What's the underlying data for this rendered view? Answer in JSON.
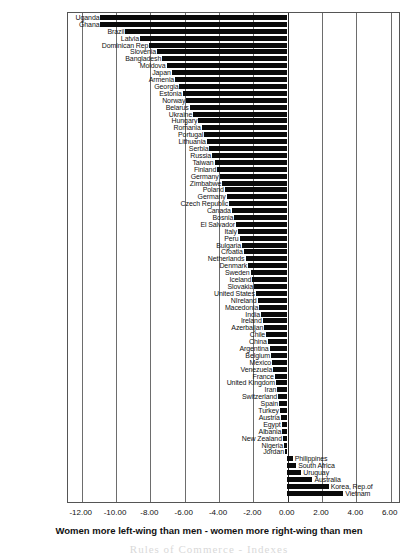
{
  "chart_data": {
    "type": "bar",
    "orientation": "horizontal",
    "title": "",
    "xlabel": "Women more left-wing than men - women more right-wing than men",
    "ylabel": "",
    "xlim": [
      -12.8,
      6.6
    ],
    "xticks": [
      -12.0,
      -10.0,
      -8.0,
      -6.0,
      -4.0,
      -2.0,
      0.0,
      2.0,
      4.0,
      6.0
    ],
    "xtick_labels": [
      "-12.00",
      "-10.00",
      "-8.00",
      "-6.00",
      "-4.00",
      "-2.00",
      "0.00",
      "2.00",
      "4.00",
      "6.00"
    ],
    "grid": true,
    "legend": "none",
    "bar_color": "#0a0a0a",
    "categories": [
      "Uganda",
      "Ghana",
      "Brazil",
      "Latvia",
      "Dominican Rep",
      "Slovenia",
      "Bangladesh",
      "Moldova",
      "Japan",
      "Armenia",
      "Georgia",
      "Estonia",
      "Norway",
      "Belarus",
      "Ukraine",
      "Hungary",
      "Romania",
      "Portugal",
      "Lithuania",
      "Serbia",
      "Russia",
      "Taiwan",
      "Finland",
      "Germany",
      "Zimbabwe",
      "Poland",
      "Germany",
      "Czech Republic",
      "Canada",
      "Bosnia",
      "El Salvador",
      "Italy",
      "Peru",
      "Bulgaria",
      "Croatia",
      "Netherlands",
      "Denmark",
      "Sweden",
      "Iceland",
      "Slovakia",
      "United States",
      "NIreland",
      "Macedonia",
      "India",
      "Ireland",
      "Azerbaijan",
      "Chile",
      "China",
      "Argentina",
      "Belgium",
      "Mexico",
      "Venezuela",
      "France",
      "United Kingdom",
      "Iran",
      "Switzerland",
      "Spain",
      "Turkey",
      "Austria",
      "Egypt",
      "Albania",
      "New Zealand",
      "Nigeria",
      "Jordan",
      "Philippines",
      "South Africa",
      "Uruguay",
      "Australia",
      "Korea, Rep.of",
      "Vietnam"
    ],
    "values": [
      -10.85,
      -10.85,
      -9.4,
      -8.55,
      -8.0,
      -7.55,
      -7.25,
      -7.0,
      -6.7,
      -6.5,
      -6.25,
      -6.05,
      -5.85,
      -5.65,
      -5.45,
      -5.15,
      -4.95,
      -4.8,
      -4.65,
      -4.5,
      -4.35,
      -4.2,
      -4.05,
      -3.9,
      -3.75,
      -3.6,
      -3.5,
      -3.35,
      -3.2,
      -3.05,
      -2.95,
      -2.85,
      -2.75,
      -2.6,
      -2.5,
      -2.4,
      -2.25,
      -2.1,
      -2.0,
      -1.9,
      -1.8,
      -1.7,
      -1.6,
      -1.5,
      -1.4,
      -1.3,
      -1.2,
      -1.1,
      -1.0,
      -0.92,
      -0.85,
      -0.78,
      -0.7,
      -0.62,
      -0.55,
      -0.5,
      -0.45,
      -0.4,
      -0.35,
      -0.3,
      -0.26,
      -0.22,
      -0.16,
      -0.1,
      0.35,
      0.55,
      0.85,
      1.5,
      2.45,
      3.3
    ]
  },
  "axis": {
    "x_title": "Women more left-wing than men - women more right-wing than men"
  },
  "watermark": {
    "text": "Rules of Commerce - Indexes"
  }
}
